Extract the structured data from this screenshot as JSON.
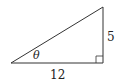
{
  "diagram": {
    "type": "right-triangle",
    "vertices": {
      "left": [
        11,
        63
      ],
      "right_angle": [
        103,
        63
      ],
      "top": [
        103,
        7
      ]
    },
    "labels": {
      "vertical_side": "5",
      "base": "12",
      "angle": "θ"
    },
    "colors": {
      "stroke": "#333333",
      "text": "#222222"
    }
  }
}
